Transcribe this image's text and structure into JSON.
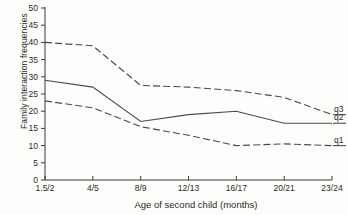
{
  "chart_data": {
    "type": "line",
    "title": "",
    "xlabel": "Age of second child (months)",
    "ylabel": "Family interaction frequencies",
    "categories": [
      "1.5/2",
      "4/5",
      "8/9",
      "12/13",
      "16/17",
      "20/21",
      "23/24"
    ],
    "yticks": [
      0,
      5,
      10,
      15,
      20,
      25,
      30,
      35,
      40,
      45,
      50
    ],
    "ylim": [
      0,
      50
    ],
    "grid": false,
    "legend_position": "right-inline",
    "series": [
      {
        "name": "q3",
        "label": "q3",
        "style": "dashed",
        "values": [
          40,
          39,
          27.5,
          27,
          26,
          24,
          19
        ]
      },
      {
        "name": "q2",
        "label": "q2",
        "style": "solid",
        "values": [
          29,
          27,
          17,
          19,
          20,
          16.5,
          16.5
        ]
      },
      {
        "name": "q1",
        "label": "q1",
        "style": "dashed",
        "values": [
          23,
          21,
          15.5,
          13,
          10,
          10.5,
          10
        ]
      }
    ]
  },
  "axes": {
    "y_tick_labels": [
      "50",
      "45",
      "40",
      "35",
      "30",
      "25",
      "20",
      "15",
      "10",
      "5",
      "0"
    ],
    "x_tick_labels": [
      "1.5/2",
      "4/5",
      "8/9",
      "12/13",
      "16/17",
      "20/21",
      "23/24"
    ]
  },
  "labels": {
    "y_axis_title": "Family interaction frequencies",
    "x_axis_title": "Age of second child (months)",
    "series_q3": "q3",
    "series_q2": "q2",
    "series_q1": "q1"
  },
  "colors": {
    "ink": "#3a3a3a",
    "line": "#4a4a4a",
    "background": "#fdfdfb"
  }
}
